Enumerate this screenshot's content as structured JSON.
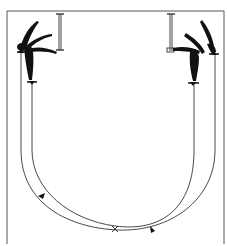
{
  "diagram": {
    "title": "Gymnast movement path diagram",
    "colors": {
      "ink": "#1a1a1a",
      "line": "#3a3a3a",
      "border": "#555555",
      "background": "#ffffff"
    },
    "elements": {
      "left_figure": {
        "label": "gymnast-left",
        "position": "top-left"
      },
      "right_figure": {
        "label": "gymnast-right",
        "position": "top-right"
      },
      "left_bar": {
        "label": "bar-left"
      },
      "right_bar": {
        "label": "bar-right"
      },
      "outer_path": {
        "label": "outer-path",
        "arrow_direction": "left-to-right along bottom"
      },
      "inner_path": {
        "label": "inner-path",
        "arrow_direction": "right-to-left along bottom"
      },
      "crossing_mark": {
        "label": "X"
      }
    }
  }
}
